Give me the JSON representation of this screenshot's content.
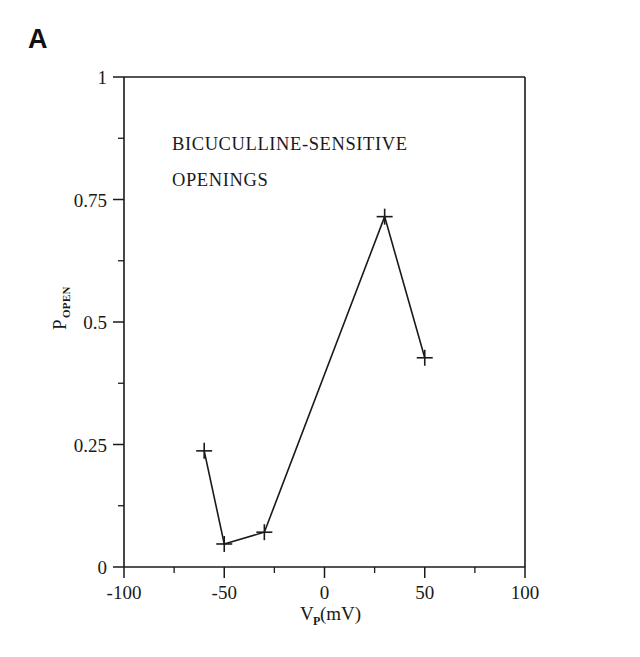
{
  "panel": {
    "label": "A"
  },
  "chart_data": {
    "type": "line",
    "title": "",
    "annotation_lines": [
      "BICUCULLINE-SENSITIVE",
      "OPENINGS"
    ],
    "xlabel_main": "V",
    "xlabel_sub": "P",
    "xlabel_unit": " (mV)",
    "xlabel_full": "V_P (mV)",
    "ylabel_main": "P",
    "ylabel_sub": "OPEN",
    "ylabel_full": "P_OPEN",
    "xlim": [
      -100,
      100
    ],
    "ylim": [
      0,
      1
    ],
    "xticks": [
      -100,
      -50,
      0,
      50,
      100
    ],
    "xtick_labels": [
      "-100",
      "-50",
      "0",
      "50",
      "100"
    ],
    "xticks_minor": [
      -75,
      -25,
      25,
      75
    ],
    "yticks": [
      0,
      0.25,
      0.5,
      0.75,
      1
    ],
    "ytick_labels": [
      "0",
      "0.25",
      "0.5",
      "0.75",
      "1"
    ],
    "yticks_minor": [
      0.125,
      0.375,
      0.625,
      0.875
    ],
    "grid": false,
    "legend": null,
    "marker": "plus",
    "series": [
      {
        "name": "Bicuculline-sensitive openings",
        "x": [
          -60,
          -50,
          -30,
          30,
          50
        ],
        "values": [
          0.237,
          0.047,
          0.071,
          0.715,
          0.427
        ]
      }
    ]
  }
}
